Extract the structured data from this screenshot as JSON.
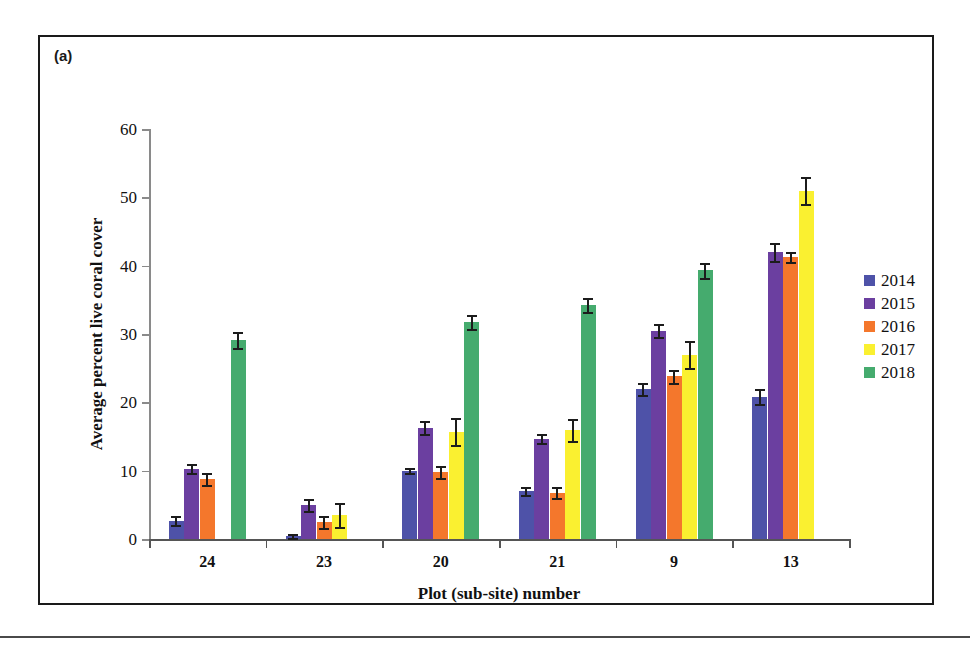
{
  "figure": {
    "panel_label": "(a)"
  },
  "chart_data": {
    "type": "bar",
    "title": "",
    "subtitle": "",
    "xlabel": "Plot (sub-site) number",
    "ylabel": "Average percent live coral cover",
    "categories": [
      "24",
      "23",
      "20",
      "21",
      "9",
      "13"
    ],
    "ylim": [
      0,
      60
    ],
    "yticks": [
      0,
      10,
      20,
      30,
      40,
      50,
      60
    ],
    "ytick_labels": [
      "0",
      "10",
      "20",
      "30",
      "40",
      "50",
      "60"
    ],
    "grid": false,
    "legend_position": "right",
    "legend_entries": [
      "2014",
      "2015",
      "2016",
      "2017",
      "2018"
    ],
    "series": [
      {
        "name": "2014",
        "color": "#4e52a8",
        "values": [
          2.7,
          0.5,
          10.0,
          7.0,
          22.0,
          20.8
        ],
        "errors": [
          0.7,
          0.3,
          0.4,
          0.6,
          0.9,
          1.1
        ]
      },
      {
        "name": "2015",
        "color": "#6b3fa0",
        "values": [
          10.3,
          5.0,
          16.3,
          14.7,
          30.5,
          42.0
        ],
        "errors": [
          0.7,
          0.9,
          0.9,
          0.6,
          0.9,
          1.3
        ]
      },
      {
        "name": "2016",
        "color": "#f4772c",
        "values": [
          8.8,
          2.5,
          9.8,
          6.8,
          23.8,
          41.3
        ],
        "errors": [
          0.9,
          0.9,
          0.9,
          0.8,
          0.9,
          0.7
        ]
      },
      {
        "name": "2017",
        "color": "#faf030",
        "values": [
          null,
          3.5,
          15.7,
          16.0,
          27.0,
          51.0
        ],
        "errors": [
          null,
          1.8,
          2.0,
          1.6,
          2.0,
          2.0
        ]
      },
      {
        "name": "2018",
        "color": "#45ab6e",
        "values": [
          29.1,
          null,
          31.8,
          34.2,
          39.3,
          null
        ],
        "errors": [
          1.2,
          null,
          1.0,
          1.0,
          1.1,
          null
        ]
      }
    ]
  }
}
